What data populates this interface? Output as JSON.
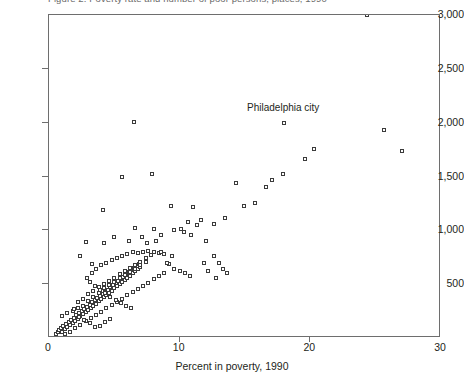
{
  "figure": {
    "title_strip": "Figure 2. Poverty rate and number of poor persons, places, 1990",
    "annotations": [
      {
        "text": "Philadelphia city",
        "x": 18.0,
        "y": 2050
      }
    ]
  },
  "chart_data": {
    "type": "scatter",
    "title": "",
    "xlabel": "Percent in poverty, 1990",
    "ylabel": "",
    "xlim": [
      0,
      30
    ],
    "ylim": [
      0,
      3000
    ],
    "xticks": [
      0,
      10,
      20,
      30
    ],
    "xtick_labels": [
      "0",
      "10",
      "20",
      "30"
    ],
    "yticks": [
      500,
      1000,
      1500,
      2000,
      2500,
      3000
    ],
    "ytick_labels": [
      "500",
      "1,000",
      "1,500",
      "2,000",
      "2,500",
      "3,000"
    ],
    "grid": false,
    "legend": null,
    "marker": "open-square",
    "marker_color": "#3b3b3b",
    "series": [
      {
        "name": "Places",
        "points": [
          [
            0.5,
            40
          ],
          [
            0.7,
            55
          ],
          [
            0.8,
            70
          ],
          [
            0.9,
            90
          ],
          [
            1.0,
            60
          ],
          [
            1.1,
            110
          ],
          [
            1.2,
            85
          ],
          [
            1.3,
            130
          ],
          [
            1.4,
            100
          ],
          [
            1.5,
            150
          ],
          [
            1.6,
            120
          ],
          [
            1.7,
            170
          ],
          [
            1.8,
            140
          ],
          [
            1.9,
            190
          ],
          [
            2.0,
            160
          ],
          [
            2.1,
            210
          ],
          [
            2.2,
            180
          ],
          [
            2.3,
            230
          ],
          [
            2.4,
            200
          ],
          [
            2.5,
            250
          ],
          [
            2.6,
            220
          ],
          [
            2.7,
            270
          ],
          [
            2.8,
            240
          ],
          [
            2.9,
            290
          ],
          [
            3.0,
            260
          ],
          [
            3.1,
            310
          ],
          [
            3.2,
            280
          ],
          [
            3.3,
            330
          ],
          [
            3.4,
            300
          ],
          [
            3.5,
            350
          ],
          [
            3.6,
            320
          ],
          [
            3.7,
            370
          ],
          [
            3.8,
            340
          ],
          [
            3.9,
            390
          ],
          [
            4.0,
            360
          ],
          [
            4.1,
            410
          ],
          [
            4.2,
            380
          ],
          [
            4.3,
            430
          ],
          [
            4.4,
            400
          ],
          [
            4.5,
            450
          ],
          [
            4.6,
            420
          ],
          [
            4.7,
            470
          ],
          [
            4.8,
            440
          ],
          [
            4.9,
            490
          ],
          [
            5.0,
            460
          ],
          [
            5.1,
            510
          ],
          [
            5.2,
            480
          ],
          [
            5.3,
            530
          ],
          [
            5.4,
            500
          ],
          [
            5.5,
            550
          ],
          [
            5.6,
            520
          ],
          [
            5.7,
            570
          ],
          [
            5.8,
            540
          ],
          [
            5.9,
            590
          ],
          [
            6.0,
            560
          ],
          [
            6.1,
            610
          ],
          [
            6.2,
            580
          ],
          [
            6.3,
            630
          ],
          [
            6.4,
            600
          ],
          [
            6.5,
            650
          ],
          [
            6.6,
            620
          ],
          [
            6.7,
            670
          ],
          [
            6.8,
            640
          ],
          [
            6.9,
            690
          ],
          [
            7.0,
            660
          ],
          [
            1.2,
            35
          ],
          [
            1.6,
            60
          ],
          [
            2.0,
            95
          ],
          [
            2.4,
            125
          ],
          [
            2.8,
            155
          ],
          [
            3.2,
            185
          ],
          [
            3.6,
            215
          ],
          [
            4.0,
            245
          ],
          [
            4.4,
            275
          ],
          [
            4.8,
            305
          ],
          [
            5.2,
            335
          ],
          [
            5.6,
            365
          ],
          [
            6.0,
            395
          ],
          [
            6.4,
            425
          ],
          [
            6.8,
            455
          ],
          [
            7.2,
            485
          ],
          [
            7.6,
            515
          ],
          [
            8.0,
            545
          ],
          [
            8.4,
            575
          ],
          [
            8.8,
            605
          ],
          [
            2.2,
            330
          ],
          [
            2.6,
            360
          ],
          [
            3.0,
            410
          ],
          [
            3.4,
            440
          ],
          [
            3.8,
            470
          ],
          [
            4.2,
            500
          ],
          [
            4.6,
            530
          ],
          [
            5.0,
            560
          ],
          [
            5.4,
            590
          ],
          [
            5.8,
            620
          ],
          [
            6.2,
            650
          ],
          [
            6.6,
            680
          ],
          [
            7.0,
            710
          ],
          [
            7.4,
            740
          ],
          [
            7.8,
            770
          ],
          [
            1.8,
            250
          ],
          [
            2.2,
            280
          ],
          [
            2.6,
            300
          ],
          [
            3.0,
            340
          ],
          [
            3.4,
            380
          ],
          [
            3.8,
            420
          ],
          [
            4.2,
            460
          ],
          [
            4.6,
            490
          ],
          [
            5.0,
            520
          ],
          [
            5.4,
            555
          ],
          [
            5.8,
            585
          ],
          [
            6.2,
            615
          ],
          [
            6.6,
            645
          ],
          [
            7.0,
            675
          ],
          [
            7.4,
            705
          ],
          [
            3.3,
            600
          ],
          [
            3.6,
            640
          ],
          [
            4.0,
            680
          ],
          [
            4.4,
            700
          ],
          [
            4.8,
            720
          ],
          [
            5.2,
            740
          ],
          [
            5.6,
            760
          ],
          [
            6.0,
            780
          ],
          [
            6.4,
            800
          ],
          [
            6.8,
            790
          ],
          [
            7.2,
            800
          ],
          [
            7.6,
            810
          ],
          [
            8.0,
            800
          ],
          [
            8.4,
            790
          ],
          [
            8.8,
            780
          ],
          [
            9.2,
            690
          ],
          [
            9.6,
            640
          ],
          [
            10.0,
            620
          ],
          [
            10.4,
            600
          ],
          [
            10.8,
            580
          ],
          [
            2.9,
            560
          ],
          [
            3.1,
            520
          ],
          [
            3.5,
            480
          ],
          [
            3.9,
            450
          ],
          [
            4.3,
            415
          ],
          [
            4.7,
            385
          ],
          [
            5.1,
            355
          ],
          [
            5.5,
            325
          ],
          [
            5.9,
            300
          ],
          [
            6.3,
            275
          ],
          [
            1.0,
            200
          ],
          [
            1.4,
            230
          ],
          [
            1.9,
            265
          ],
          [
            2.3,
            195
          ],
          [
            2.7,
            165
          ],
          [
            3.1,
            135
          ],
          [
            3.5,
            105
          ],
          [
            3.9,
            115
          ],
          [
            4.3,
            145
          ],
          [
            4.7,
            175
          ],
          [
            2.4,
            760
          ],
          [
            2.8,
            890
          ],
          [
            4.2,
            880
          ],
          [
            5.0,
            940
          ],
          [
            3.3,
            690
          ],
          [
            6.1,
            900
          ],
          [
            6.6,
            1020
          ],
          [
            7.1,
            940
          ],
          [
            7.5,
            880
          ],
          [
            8.2,
            900
          ],
          [
            8.6,
            960
          ],
          [
            4.1,
            1190
          ],
          [
            5.6,
            1500
          ],
          [
            6.5,
            2010
          ],
          [
            7.9,
            1520
          ],
          [
            9.3,
            1230
          ],
          [
            9.6,
            1000
          ],
          [
            10.1,
            1010
          ],
          [
            10.3,
            980
          ],
          [
            10.6,
            1080
          ],
          [
            10.9,
            960
          ],
          [
            11.3,
            1050
          ],
          [
            11.6,
            1100
          ],
          [
            11.9,
            700
          ],
          [
            12.2,
            620
          ],
          [
            12.6,
            760
          ],
          [
            13.0,
            700
          ],
          [
            13.3,
            640
          ],
          [
            11.0,
            1220
          ],
          [
            12.6,
            1060
          ],
          [
            13.5,
            1110
          ],
          [
            14.3,
            1440
          ],
          [
            14.9,
            1230
          ],
          [
            15.8,
            1250
          ],
          [
            16.6,
            1400
          ],
          [
            17.1,
            1470
          ],
          [
            17.9,
            1520
          ],
          [
            19.6,
            1660
          ],
          [
            20.3,
            1760
          ],
          [
            18.0,
            2000
          ],
          [
            24.3,
            3000
          ],
          [
            25.6,
            1930
          ],
          [
            27.0,
            1740
          ],
          [
            8.0,
            1010
          ],
          [
            8.6,
            800
          ],
          [
            9.0,
            700
          ],
          [
            9.4,
            760
          ],
          [
            12.0,
            900
          ],
          [
            12.8,
            560
          ],
          [
            13.6,
            600
          ]
        ]
      }
    ]
  }
}
